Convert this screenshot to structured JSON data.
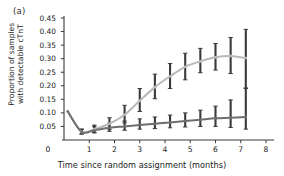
{
  "figure": {
    "panel_label": "(a)",
    "background": "#ffffff"
  },
  "axes": {
    "y_label_line1": "Proportion of samples",
    "y_label_line2": "with detectable cTnT",
    "x_label": "Time since random assignment (months)",
    "y_ticks": [
      "0.45",
      "0.40",
      "0.35",
      "0.30",
      "0.25",
      "0.20",
      "0.15",
      "0.10",
      "0.05"
    ],
    "y_origin_label": "0",
    "x_ticks": [
      "0",
      "1",
      "2",
      "3",
      "4",
      "5",
      "6",
      "7",
      "8"
    ]
  },
  "colors": {
    "series_light": "#b9b9b9",
    "series_dark": "#6e6e6e",
    "errorbar": "#3a3a3a",
    "axis": "#3a3a3a",
    "text": "#1d1d1d"
  },
  "chart_data": {
    "type": "line",
    "title": "",
    "xlabel": "Time since random assignment (months)",
    "ylabel": "Proportion of samples with detectable cTnT",
    "xlim": [
      0,
      8
    ],
    "ylim": [
      0,
      0.45
    ],
    "yticks": [
      0,
      0.05,
      0.1,
      0.15,
      0.2,
      0.25,
      0.3,
      0.35,
      0.4,
      0.45
    ],
    "xticks": [
      0,
      1,
      2,
      3,
      4,
      5,
      6,
      7,
      8
    ],
    "grid": false,
    "legend": "none",
    "errorbars": true,
    "series": [
      {
        "name": "upper-curve",
        "color": "#b9b9b9",
        "x": [
          0.15,
          0.7,
          1.2,
          1.8,
          2.4,
          3.0,
          3.6,
          4.2,
          4.8,
          5.4,
          6.0,
          6.6,
          7.2
        ],
        "y": [
          0.105,
          0.03,
          0.04,
          0.06,
          0.093,
          0.145,
          0.195,
          0.235,
          0.27,
          0.29,
          0.305,
          0.31,
          0.302
        ],
        "ylow": [
          null,
          0.022,
          0.028,
          0.04,
          0.063,
          0.105,
          0.152,
          0.19,
          0.222,
          0.248,
          0.258,
          0.245,
          0.192
        ],
        "yhigh": [
          null,
          0.04,
          0.055,
          0.082,
          0.128,
          0.19,
          0.243,
          0.282,
          0.32,
          0.338,
          0.356,
          0.378,
          0.408
        ]
      },
      {
        "name": "lower-curve",
        "color": "#6e6e6e",
        "x": [
          0.15,
          0.7,
          1.2,
          1.8,
          2.4,
          3.0,
          3.6,
          4.2,
          4.8,
          5.4,
          6.0,
          6.6,
          7.2
        ],
        "y": [
          0.105,
          0.03,
          0.036,
          0.045,
          0.05,
          0.055,
          0.06,
          0.065,
          0.07,
          0.075,
          0.08,
          0.082,
          0.085
        ],
        "ylow": [
          null,
          0.022,
          0.026,
          0.032,
          0.036,
          0.04,
          0.042,
          0.045,
          0.048,
          0.05,
          0.05,
          0.046,
          0.04
        ],
        "yhigh": [
          null,
          0.04,
          0.05,
          0.062,
          0.07,
          0.078,
          0.085,
          0.092,
          0.1,
          0.11,
          0.125,
          0.148,
          0.19
        ]
      }
    ]
  }
}
